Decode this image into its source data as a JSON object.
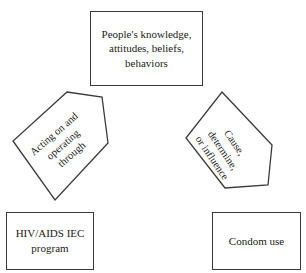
{
  "diagram": {
    "type": "conceptual-flow",
    "background_color": "#ffffff",
    "stroke_color": "#3a3a3a",
    "text_color": "#1a1a1a",
    "cropped_title_remnant": "",
    "nodes": [
      {
        "id": "knowledge",
        "shape": "rectangle",
        "label": "People's knowledge,\nattitudes, beliefs,\nbehaviors"
      },
      {
        "id": "program",
        "shape": "rectangle",
        "label": "HIV/AIDS IEC\nprogram"
      },
      {
        "id": "condom",
        "shape": "rectangle",
        "label": "Condom use"
      }
    ],
    "connectors": [
      {
        "id": "acting",
        "shape": "pentagon",
        "label": "Acting on and\noperating\nthrough",
        "rotation_deg": -41,
        "points": "67,92 102,97 108,143 55,200 13,141"
      },
      {
        "id": "cause",
        "shape": "pentagon",
        "label": "Cause,\ndetermine,\nor influence",
        "rotation_deg": 56,
        "points": "222,92 272,145 268,185 225,188 186,138"
      }
    ]
  }
}
